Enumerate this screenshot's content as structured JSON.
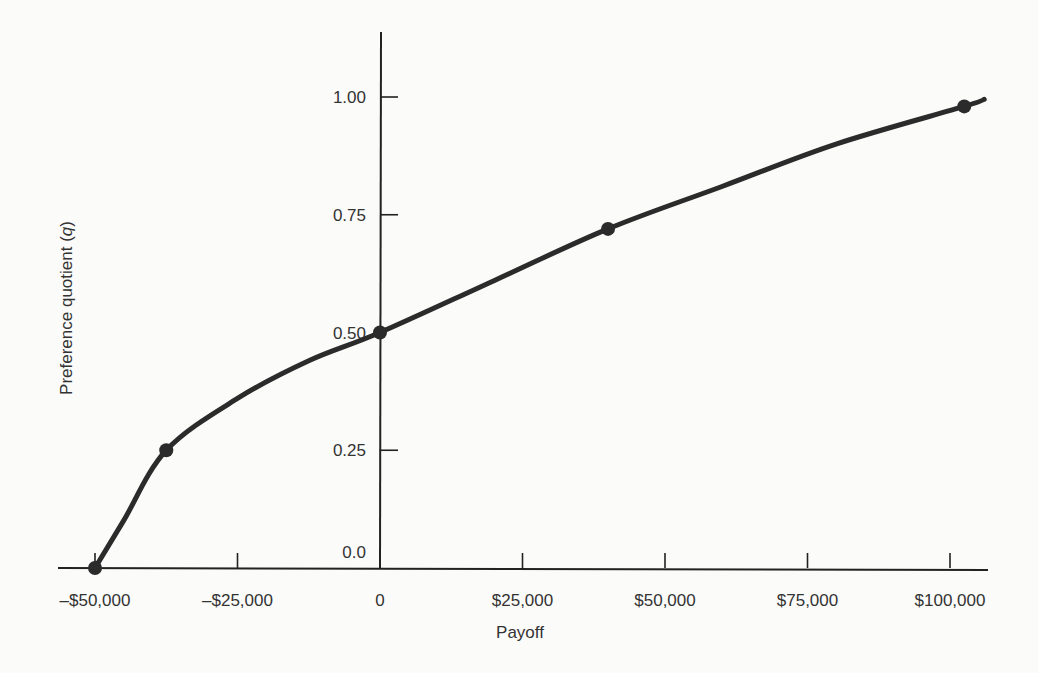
{
  "chart_data": {
    "type": "line",
    "title": "",
    "xlabel": "Payoff",
    "ylabel": "Preference quotient (q)",
    "ylabel_parts": {
      "text": "Preference quotient (",
      "italic": "q",
      "close": ")"
    },
    "x_ticks": [
      {
        "value": -50000,
        "label": "–$50,000"
      },
      {
        "value": -25000,
        "label": "–$25,000"
      },
      {
        "value": 0,
        "label": "0"
      },
      {
        "value": 25000,
        "label": "$25,000"
      },
      {
        "value": 50000,
        "label": "$50,000"
      },
      {
        "value": 75000,
        "label": "$75,000"
      },
      {
        "value": 100000,
        "label": "$100,000"
      }
    ],
    "y_ticks": [
      {
        "value": 0.0,
        "label": "0.0"
      },
      {
        "value": 0.25,
        "label": "0.25"
      },
      {
        "value": 0.5,
        "label": "0.50"
      },
      {
        "value": 0.75,
        "label": "0.75"
      },
      {
        "value": 1.0,
        "label": "1.00"
      }
    ],
    "xlim": [
      -52000,
      106000
    ],
    "ylim": [
      0,
      1.14
    ],
    "grid": false,
    "legend": null,
    "series": [
      {
        "name": "Utility curve",
        "marked_points": [
          {
            "x": -50000,
            "y": 0.0
          },
          {
            "x": -37500,
            "y": 0.25
          },
          {
            "x": 0,
            "y": 0.5
          },
          {
            "x": 40000,
            "y": 0.72
          },
          {
            "x": 102500,
            "y": 0.98
          }
        ],
        "curve": [
          {
            "x": -50000,
            "y": 0.0
          },
          {
            "x": -45000,
            "y": 0.1
          },
          {
            "x": -37500,
            "y": 0.25
          },
          {
            "x": -25000,
            "y": 0.36
          },
          {
            "x": -12500,
            "y": 0.44
          },
          {
            "x": 0,
            "y": 0.5
          },
          {
            "x": 20000,
            "y": 0.61
          },
          {
            "x": 40000,
            "y": 0.72
          },
          {
            "x": 60000,
            "y": 0.81
          },
          {
            "x": 80000,
            "y": 0.9
          },
          {
            "x": 102500,
            "y": 0.98
          },
          {
            "x": 106000,
            "y": 0.995
          }
        ]
      }
    ]
  }
}
